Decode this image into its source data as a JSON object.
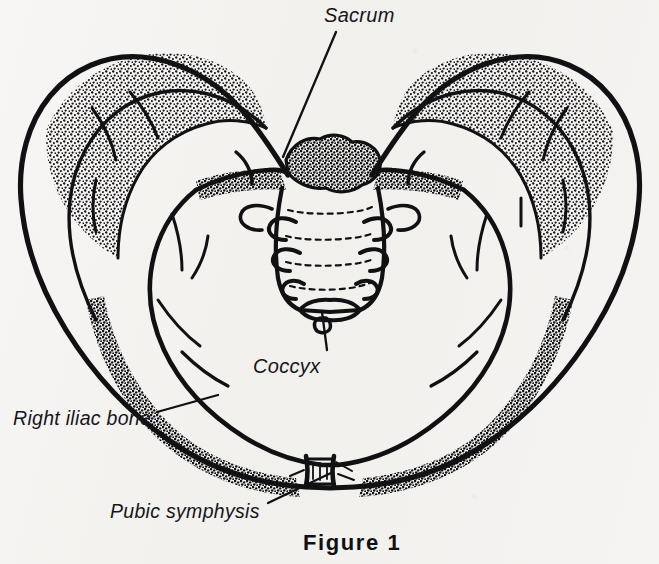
{
  "figure": {
    "caption": "Figure 1",
    "style": "black-and-white stippled line drawing on scanned paper",
    "background_color": "#f4f3f1",
    "ink_color": "#111114"
  },
  "labels": [
    {
      "id": "sacrum",
      "text": "Sacrum",
      "position": "top-center",
      "leader_line": {
        "from_x": 336,
        "from_y": 32,
        "to_x": 283,
        "to_y": 157
      }
    },
    {
      "id": "coccyx",
      "text": "Coccyx",
      "position": "center-below",
      "leader_line": {
        "from_x": 327,
        "from_y": 350,
        "to_x": 323,
        "to_y": 312
      }
    },
    {
      "id": "right-iliac-bone",
      "text": "Right iliac bone",
      "position": "left",
      "leader_line": {
        "from_x": 157,
        "from_y": 412,
        "to_x": 218,
        "to_y": 395
      }
    },
    {
      "id": "pubic-symphysis",
      "text": "Pubic symphysis",
      "position": "bottom-left",
      "leader_line": {
        "from_x": 268,
        "from_y": 503,
        "to_x": 330,
        "to_y": 472
      }
    }
  ],
  "anatomy": {
    "parts": [
      "right iliac bone",
      "left iliac bone",
      "iliac crest",
      "iliac fossa",
      "sacral promontory",
      "sacrum",
      "sacral foramina",
      "coccyx",
      "pelvic brim",
      "superior pubic ramus",
      "inferior pubic ramus",
      "pubic symphysis"
    ],
    "sacral_foramina_pairs": 3,
    "sacral_transverse_lines": 4
  }
}
